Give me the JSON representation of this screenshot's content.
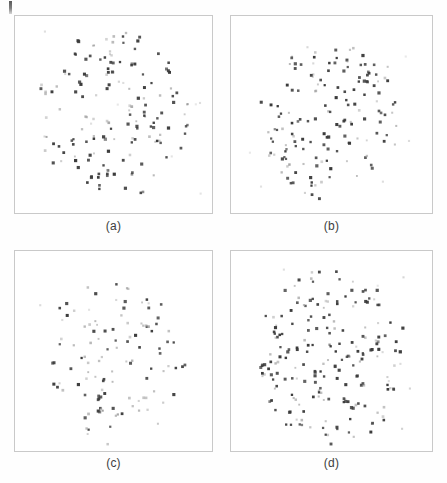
{
  "page": {
    "background_color": "#fefefe",
    "width": 447,
    "height": 483,
    "artifact_label": ""
  },
  "figure": {
    "layout": "2x2-grid",
    "panel_border_color": "#c9c9c9",
    "panel_background_color": "#ffffff",
    "caption_color": "#3d3d3d",
    "dot_color_dark": "#3a3a3a",
    "dot_color_light": "#9b9b9b"
  },
  "captions": {
    "a": "(a)",
    "b": "(b)",
    "c": "(c)",
    "d": "(d)"
  },
  "chart_data": [
    {
      "type": "scatter",
      "panel": "a",
      "title": "(a)",
      "xlabel": "",
      "ylabel": "",
      "xlim": [
        0,
        1
      ],
      "ylim": [
        0,
        1
      ],
      "grid": false,
      "legend": "none",
      "marker_size_px": 2.6,
      "n_points": 158,
      "seed": 1307,
      "distribution": "annular-blob",
      "cluster": {
        "cx": 0.5,
        "cy": 0.5,
        "rx": 0.4,
        "ry": 0.44,
        "hollow": 0.18
      },
      "dark_fraction": 0.62
    },
    {
      "type": "scatter",
      "panel": "b",
      "title": "(b)",
      "xlabel": "",
      "ylabel": "",
      "xlim": [
        0,
        1
      ],
      "ylim": [
        0,
        1
      ],
      "grid": false,
      "legend": "none",
      "marker_size_px": 2.6,
      "n_points": 152,
      "seed": 4421,
      "distribution": "blob",
      "cluster": {
        "cx": 0.5,
        "cy": 0.52,
        "rx": 0.36,
        "ry": 0.42,
        "hollow": 0.05
      },
      "dark_fraction": 0.7
    },
    {
      "type": "scatter",
      "panel": "c",
      "title": "(c)",
      "xlabel": "",
      "ylabel": "",
      "xlim": [
        0,
        1
      ],
      "ylim": [
        0,
        1
      ],
      "grid": false,
      "legend": "none",
      "marker_size_px": 2.6,
      "n_points": 112,
      "seed": 9158,
      "distribution": "sparse-blob",
      "cluster": {
        "cx": 0.5,
        "cy": 0.55,
        "rx": 0.36,
        "ry": 0.42,
        "hollow": 0.02
      },
      "dark_fraction": 0.66
    },
    {
      "type": "scatter",
      "panel": "d",
      "title": "(d)",
      "xlabel": "",
      "ylabel": "",
      "xlim": [
        0,
        1
      ],
      "ylim": [
        0,
        1
      ],
      "grid": false,
      "legend": "none",
      "marker_size_px": 2.6,
      "n_points": 205,
      "seed": 2764,
      "distribution": "dense-blob",
      "cluster": {
        "cx": 0.5,
        "cy": 0.53,
        "rx": 0.38,
        "ry": 0.44,
        "hollow": 0.02
      },
      "dark_fraction": 0.68
    }
  ]
}
